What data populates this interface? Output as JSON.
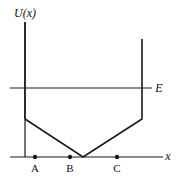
{
  "diagram": {
    "y_axis_label": "U(x)",
    "x_axis_label": "x",
    "energy_label": "E",
    "points": [
      {
        "label": "A",
        "x": 35
      },
      {
        "label": "B",
        "x": 70
      },
      {
        "label": "C",
        "x": 117
      }
    ],
    "potential_curve": {
      "description": "Potential well: vertical left wall, linear slope down to minimum between B and C at U=0, linear slope up to vertical right wall",
      "vertices": [
        [
          25,
          22
        ],
        [
          25,
          119
        ],
        [
          83,
          157
        ],
        [
          142,
          119
        ],
        [
          142,
          39
        ]
      ]
    },
    "energy_level_y": 88,
    "colors": {
      "line": "#1a1a1a",
      "background": "#ffffff"
    }
  }
}
